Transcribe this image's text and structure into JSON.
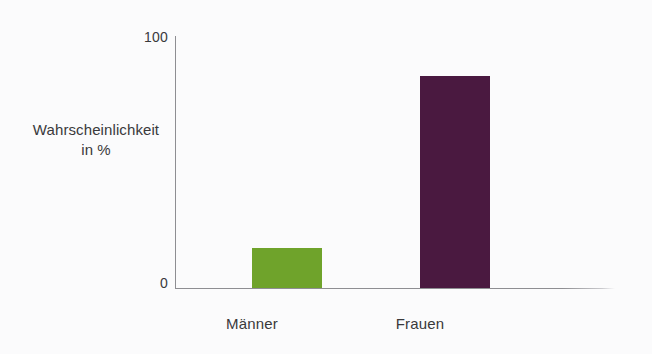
{
  "chart_data": {
    "type": "bar",
    "title": "",
    "xlabel": "",
    "ylabel": "Wahrscheinlichkeit in %",
    "ylabel_lines": [
      "Wahrscheinlichkeit",
      "in %"
    ],
    "categories": [
      "Männer",
      "Frauen"
    ],
    "values": [
      16,
      84
    ],
    "ylim": [
      0,
      100
    ],
    "ytick_labels": [
      "0",
      "100"
    ],
    "yticks": [
      0,
      100
    ],
    "grid": false,
    "legend": false,
    "bar_colors": [
      "#6fa32b",
      "#4a1940"
    ],
    "axis_color": "#8e8e92",
    "background_color": "#fbfbfc",
    "text_color": "#39393b"
  }
}
